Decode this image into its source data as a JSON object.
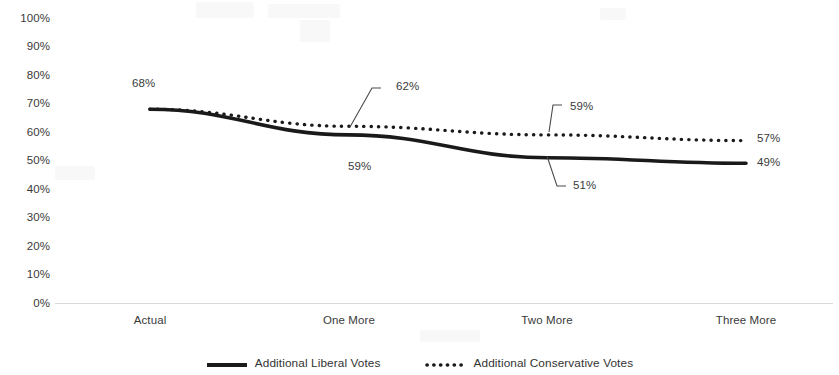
{
  "chart_data": {
    "type": "line",
    "title": "",
    "xlabel": "",
    "ylabel": "",
    "categories": [
      "Actual",
      "One More",
      "Two More",
      "Three More"
    ],
    "ylim": [
      0,
      100
    ],
    "y_ticks": [
      "0%",
      "10%",
      "20%",
      "30%",
      "40%",
      "50%",
      "60%",
      "70%",
      "80%",
      "90%",
      "100%"
    ],
    "y_tick_values": [
      0,
      10,
      20,
      30,
      40,
      50,
      60,
      70,
      80,
      90,
      100
    ],
    "grid": false,
    "legend_position": "bottom",
    "series": [
      {
        "name": "Additional Liberal Votes",
        "style": "solid",
        "color": "#1a1a1a",
        "values": [
          68,
          59,
          51,
          49
        ],
        "labels": [
          "68%",
          "59%",
          "51%",
          "49%"
        ]
      },
      {
        "name": "Additional Conservative Votes",
        "style": "dotted",
        "color": "#1a1a1a",
        "values": [
          68,
          62,
          59,
          57
        ],
        "labels": [
          "68%",
          "62%",
          "59%",
          "57%"
        ]
      }
    ],
    "annotations": [
      {
        "text": "68%",
        "series": "Additional Liberal Votes",
        "category": "Actual",
        "value": 68,
        "leader": false
      },
      {
        "text": "62%",
        "series": "Additional Conservative Votes",
        "category": "One More",
        "value": 62,
        "leader": true
      },
      {
        "text": "59%",
        "series": "Additional Liberal Votes",
        "category": "One More",
        "value": 59,
        "leader": false
      },
      {
        "text": "59%",
        "series": "Additional Conservative Votes",
        "category": "Two More",
        "value": 59,
        "leader": true
      },
      {
        "text": "51%",
        "series": "Additional Liberal Votes",
        "category": "Two More",
        "value": 51,
        "leader": true
      },
      {
        "text": "57%",
        "series": "Additional Conservative Votes",
        "category": "Three More",
        "value": 57,
        "leader": false
      },
      {
        "text": "49%",
        "series": "Additional Liberal Votes",
        "category": "Three More",
        "value": 49,
        "leader": false
      }
    ]
  },
  "y_axis": {
    "ticks": [
      {
        "label": "100%",
        "top": 12
      },
      {
        "label": "90%",
        "top": 40
      },
      {
        "label": "80%",
        "top": 69
      },
      {
        "label": "70%",
        "top": 97
      },
      {
        "label": "60%",
        "top": 126
      },
      {
        "label": "50%",
        "top": 154
      },
      {
        "label": "40%",
        "top": 183
      },
      {
        "label": "30%",
        "top": 211
      },
      {
        "label": "20%",
        "top": 240
      },
      {
        "label": "10%",
        "top": 268
      },
      {
        "label": "0%",
        "top": 297
      }
    ]
  },
  "x_axis": {
    "ticks": [
      {
        "label": "Actual",
        "left": 150
      },
      {
        "label": "One More",
        "left": 349
      },
      {
        "label": "Two More",
        "left": 547
      },
      {
        "label": "Three More",
        "left": 746
      }
    ]
  },
  "point_labels": [
    {
      "text": "68%",
      "left": 132,
      "top": 77
    },
    {
      "text": "62%",
      "left": 396,
      "top": 80
    },
    {
      "text": "59%",
      "left": 348,
      "top": 160
    },
    {
      "text": "59%",
      "left": 570,
      "top": 100
    },
    {
      "text": "51%",
      "left": 573,
      "top": 179
    },
    {
      "text": "57%",
      "left": 757,
      "top": 132
    },
    {
      "text": "49%",
      "left": 757,
      "top": 156
    }
  ],
  "legend": {
    "entries": [
      {
        "label": "Additional Liberal Votes",
        "style": "solid"
      },
      {
        "label": "Additional Conservative Votes",
        "style": "dotted"
      }
    ]
  },
  "colors": {
    "series_line": "#1a1a1a",
    "axis_line": "#d9d9d9",
    "text": "#3a3a3a",
    "background": "#ffffff"
  }
}
